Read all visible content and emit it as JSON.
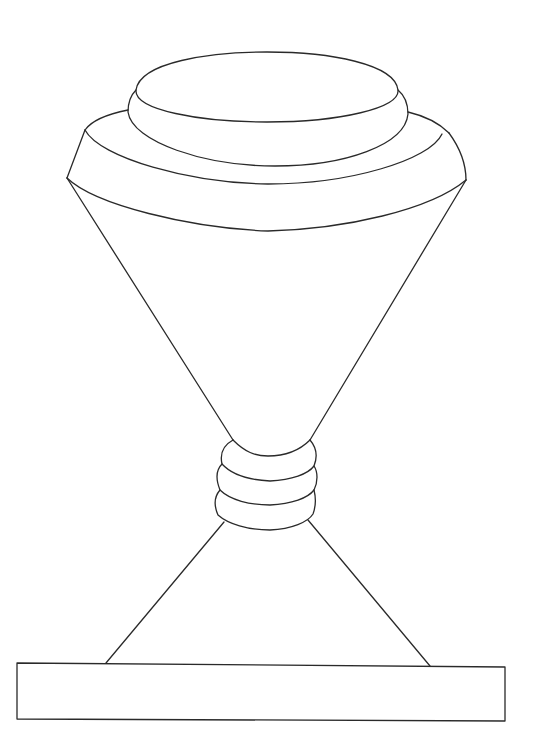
{
  "figure": {
    "stroke_color": "#2a2a2a",
    "background_color": "#ffffff",
    "parts": [
      "top-ellipse",
      "upper-disk",
      "middle-tier",
      "cone-body",
      "neck-rings",
      "support-legs",
      "base-slab"
    ]
  }
}
